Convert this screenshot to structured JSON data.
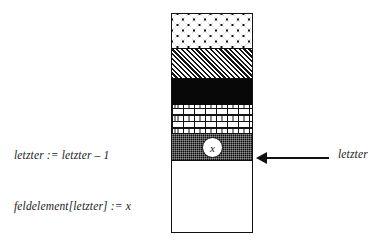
{
  "diagram": {
    "pseudocode": {
      "lines": [
        "letzter := letzter – 1",
        "feldelement[letzter] := x"
      ]
    },
    "pointer": {
      "label": "letzter",
      "arrow_icon": "left-arrow-icon"
    },
    "stack": {
      "marker_label": "x",
      "bands": [
        {
          "name": "band-circles",
          "fill": "circles-pattern",
          "top": 0,
          "height": 35
        },
        {
          "name": "band-hatch",
          "fill": "diagonal-hatch",
          "top": 35,
          "height": 30
        },
        {
          "name": "band-black",
          "fill": "solid-black",
          "top": 65,
          "height": 26
        },
        {
          "name": "band-brick",
          "fill": "brick-pattern",
          "top": 91,
          "height": 29
        },
        {
          "name": "band-stipple",
          "fill": "fine-checker",
          "top": 120,
          "height": 27
        },
        {
          "name": "band-empty",
          "fill": "empty-white",
          "top": 147,
          "height": 70
        }
      ]
    },
    "colors": {
      "ink": "#111111",
      "paper": "#ffffff"
    }
  }
}
